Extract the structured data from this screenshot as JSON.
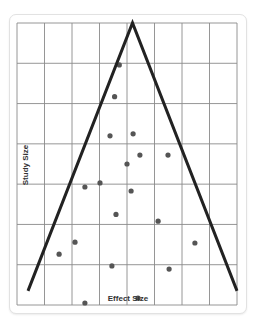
{
  "chart_data": {
    "type": "scatter",
    "subtype": "funnel-plot",
    "title": "",
    "xlabel": "Effect Size",
    "ylabel": "Study Size",
    "grid": true,
    "grid_columns": 8,
    "grid_rows": 7,
    "legend": null,
    "xlim": [
      0,
      8
    ],
    "ylim": [
      0,
      7
    ],
    "funnel": {
      "apex": [
        4.2,
        7.0
      ],
      "left_base": [
        0.4,
        0.35
      ],
      "right_base": [
        8.0,
        0.35
      ],
      "color": "#222222"
    },
    "points": [
      {
        "x": 3.72,
        "y": 5.96
      },
      {
        "x": 3.55,
        "y": 5.17
      },
      {
        "x": 3.38,
        "y": 4.2
      },
      {
        "x": 4.22,
        "y": 4.25
      },
      {
        "x": 4.47,
        "y": 3.72
      },
      {
        "x": 5.49,
        "y": 3.72
      },
      {
        "x": 4.0,
        "y": 3.5
      },
      {
        "x": 3.02,
        "y": 3.03
      },
      {
        "x": 2.47,
        "y": 2.93
      },
      {
        "x": 4.15,
        "y": 2.83
      },
      {
        "x": 3.6,
        "y": 2.25
      },
      {
        "x": 5.13,
        "y": 2.08
      },
      {
        "x": 2.11,
        "y": 1.56
      },
      {
        "x": 1.53,
        "y": 1.26
      },
      {
        "x": 6.47,
        "y": 1.54
      },
      {
        "x": 3.45,
        "y": 0.97
      },
      {
        "x": 5.53,
        "y": 0.89
      },
      {
        "x": 4.4,
        "y": 0.17
      },
      {
        "x": 2.47,
        "y": 0.05
      }
    ],
    "point_color": "#555555"
  }
}
